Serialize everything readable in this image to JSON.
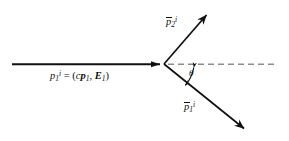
{
  "figure": {
    "kind": "particle-scattering-diagram",
    "background_color": "#ffffff",
    "stroke_color": "#101010",
    "dashed_color": "#8c8c8c",
    "vertex": {
      "x": 164,
      "y": 64
    },
    "labels": {
      "incoming_momentum": {
        "name": "incoming-four-momentum-label",
        "plain_text": "p1^i = (cp1, E1)",
        "base": "p",
        "subscript": "1",
        "superscript": "i",
        "equals": "=",
        "open_paren": "(",
        "c_factor": "c",
        "vector_base": "p",
        "vector_subscript": "1",
        "comma": ",",
        "energy_base": "E",
        "energy_subscript": "1",
        "close_paren": ")"
      },
      "outgoing_upper": {
        "name": "outgoing-momentum-p2-label",
        "plain_text": "p2-bar^i",
        "base": "p",
        "subscript": "2",
        "superscript": "i"
      },
      "outgoing_lower": {
        "name": "outgoing-momentum-p1-label",
        "plain_text": "p1-bar^i",
        "base": "p",
        "subscript": "1",
        "superscript": "i"
      },
      "scattering_angle": {
        "name": "scattering-angle-label",
        "plain_text": "theta",
        "symbol": "θ"
      }
    },
    "elements": {
      "incoming_ray": {
        "name": "incoming-particle-ray",
        "x1": 12,
        "y1": 64,
        "x2": 164,
        "y2": 64,
        "arrowhead": "solid-filled-at-vertex"
      },
      "reference_axis": {
        "name": "horizontal-reference-dashed-axis",
        "x1": 167,
        "y1": 64,
        "x2": 277,
        "y2": 64,
        "style": "dashed"
      },
      "outgoing_upper_ray": {
        "name": "outgoing-upper-ray",
        "x1": 164,
        "y1": 64,
        "x2": 209,
        "y2": 12,
        "arrowhead": "open-at-tip"
      },
      "outgoing_lower_ray": {
        "name": "outgoing-lower-ray",
        "x1": 164,
        "y1": 64,
        "x2": 248,
        "y2": 132,
        "arrowhead": "open-at-tip"
      },
      "angle_marker": {
        "name": "scattering-angle-double-arrow",
        "style": "double-headed-arc",
        "from_x": 194,
        "from_y": 65,
        "to_x": 185,
        "to_y": 87
      }
    }
  }
}
